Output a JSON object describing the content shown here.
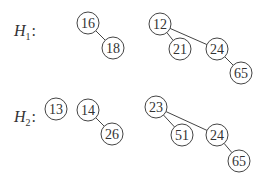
{
  "heaps": [
    {
      "name": "H",
      "subscript": "1",
      "colon": ":",
      "label_pos": [
        14,
        36
      ],
      "nodes": [
        {
          "id": "h1n16",
          "key": "16",
          "x": 88,
          "y": 23
        },
        {
          "id": "h1n18",
          "key": "18",
          "x": 113,
          "y": 48
        },
        {
          "id": "h1n12",
          "key": "12",
          "x": 160,
          "y": 24
        },
        {
          "id": "h1n21",
          "key": "21",
          "x": 180,
          "y": 49
        },
        {
          "id": "h1n24",
          "key": "24",
          "x": 217,
          "y": 49
        },
        {
          "id": "h1n65",
          "key": "65",
          "x": 241,
          "y": 73
        }
      ],
      "edges": [
        [
          "h1n16",
          "h1n18"
        ],
        [
          "h1n12",
          "h1n21"
        ],
        [
          "h1n12",
          "h1n24"
        ],
        [
          "h1n24",
          "h1n65"
        ]
      ]
    },
    {
      "name": "H",
      "subscript": "2",
      "colon": ":",
      "label_pos": [
        14,
        122
      ],
      "nodes": [
        {
          "id": "h2n13",
          "key": "13",
          "x": 56,
          "y": 109
        },
        {
          "id": "h2n14",
          "key": "14",
          "x": 88,
          "y": 110
        },
        {
          "id": "h2n26",
          "key": "26",
          "x": 112,
          "y": 134
        },
        {
          "id": "h2n23",
          "key": "23",
          "x": 156,
          "y": 107
        },
        {
          "id": "h2n51",
          "key": "51",
          "x": 182,
          "y": 135
        },
        {
          "id": "h2n24",
          "key": "24",
          "x": 217,
          "y": 135
        },
        {
          "id": "h2n65",
          "key": "65",
          "x": 239,
          "y": 161
        }
      ],
      "edges": [
        [
          "h2n14",
          "h2n26"
        ],
        [
          "h2n23",
          "h2n51"
        ],
        [
          "h2n23",
          "h2n24"
        ],
        [
          "h2n24",
          "h2n65"
        ]
      ]
    }
  ],
  "node_radius": 11
}
